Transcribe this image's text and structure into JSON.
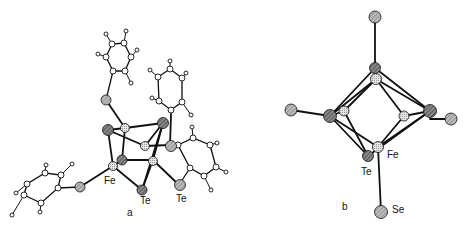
{
  "figure": {
    "panel_a": {
      "label": "a",
      "atom_labels": {
        "fe": "Fe",
        "te1": "Te",
        "te2": "Te"
      }
    },
    "panel_b": {
      "label": "b",
      "atom_labels": {
        "fe": "Fe",
        "te": "Te",
        "se": "Se"
      }
    }
  },
  "colors": {
    "bond": "#111111",
    "fe_atom": "#d8d8d8",
    "te_atom": "#777777",
    "se_atom": "#a8a8a8",
    "h_atom": "#ffffff"
  }
}
